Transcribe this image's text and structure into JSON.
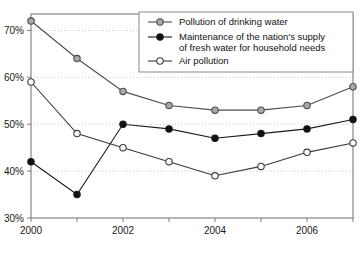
{
  "chart_data": {
    "type": "line",
    "title": "",
    "subtitle": "",
    "xlabel": "",
    "ylabel": "",
    "x": [
      2000,
      2001,
      2002,
      2003,
      2004,
      2005,
      2006,
      2007
    ],
    "xtick_labels": [
      "2000",
      "",
      "2002",
      "",
      "2004",
      "",
      "2006",
      ""
    ],
    "xtick_labels_shown": [
      "2000",
      "2002",
      "2004",
      "2006"
    ],
    "ytick_labels": [
      "30%",
      "40%",
      "50%",
      "60%",
      "70%"
    ],
    "ytick_values": [
      30,
      40,
      50,
      60,
      70
    ],
    "ylim": [
      30,
      73.5
    ],
    "xlim": [
      2000,
      2007
    ],
    "grid": true,
    "grid_style": "dotted-horizontal",
    "legend_position": "top-right",
    "series": [
      {
        "name": "Pollution of drinking water",
        "marker": "circle-gray-filled",
        "color": "#4d4d4d",
        "marker_fill": "#a9a9a9",
        "values": [
          72,
          64,
          57,
          54,
          53,
          53,
          54,
          58
        ]
      },
      {
        "name": "Maintenance of the nation's supply of fresh water for household needs",
        "name_line1": "Maintenance of the nation's supply",
        "name_line2": "of fresh water for household needs",
        "marker": "circle-black-filled",
        "color": "#1a1a1a",
        "marker_fill": "#111111",
        "values": [
          42,
          35,
          50,
          49,
          47,
          48,
          49,
          51
        ]
      },
      {
        "name": "Air pollution",
        "marker": "circle-open",
        "color": "#3a3a3a",
        "marker_fill": "#ffffff",
        "values": [
          59,
          48,
          45,
          42,
          39,
          41,
          44,
          46
        ]
      }
    ]
  },
  "legend": {
    "entries": [
      {
        "label": "Pollution of drinking water"
      },
      {
        "label": "Maintenance of the nation's supply"
      },
      {
        "label": "of fresh water for household needs"
      },
      {
        "label": "Air pollution"
      }
    ]
  },
  "colors": {
    "frame": "#888888",
    "gridline": "#cccccc",
    "axis_text": "#1a1a1a",
    "legend_border": "#8a8a8a",
    "background": "#ffffff"
  }
}
